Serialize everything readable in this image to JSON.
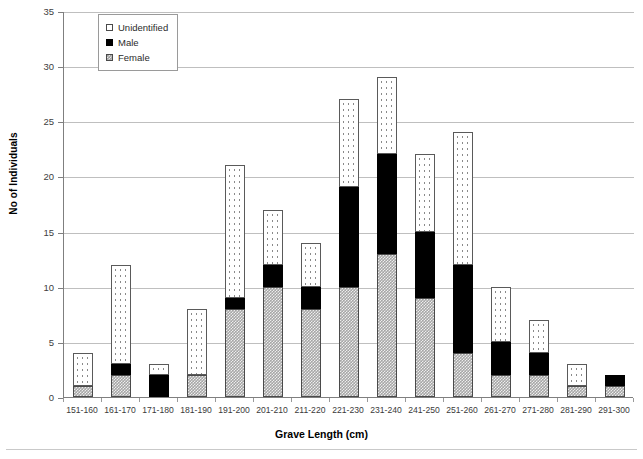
{
  "chart_data": {
    "type": "bar",
    "subtype": "stacked-vertical",
    "title": "",
    "xlabel": "Grave Length (cm)",
    "ylabel": "No of Individuals",
    "ylim": [
      0,
      35
    ],
    "ytick_step": 5,
    "yticks": [
      "0",
      "5",
      "10",
      "15",
      "20",
      "25",
      "30",
      "35"
    ],
    "grid": "horizontal",
    "legend_position": "top-left-inside",
    "categories": [
      "151-160",
      "161-170",
      "171-180",
      "181-190",
      "191-200",
      "201-210",
      "211-220",
      "221-230",
      "231-240",
      "241-250",
      "251-260",
      "261-270",
      "271-280",
      "281-290",
      "291-300"
    ],
    "series": [
      {
        "name": "Female",
        "fill": "checkered-gray",
        "color": "#a6a6a6",
        "values": [
          1,
          2,
          0,
          2,
          8,
          10,
          8,
          10,
          13,
          9,
          4,
          2,
          2,
          1,
          1
        ]
      },
      {
        "name": "Male",
        "fill": "solid-black",
        "color": "#000000",
        "values": [
          0,
          1,
          2,
          0,
          1,
          2,
          2,
          9,
          9,
          6,
          8,
          3,
          2,
          0,
          1
        ]
      },
      {
        "name": "Unidentified",
        "fill": "white-dotted",
        "color": "#ffffff",
        "values": [
          3,
          9,
          1,
          6,
          12,
          5,
          4,
          8,
          7,
          7,
          12,
          5,
          3,
          2,
          0
        ]
      }
    ],
    "totals": [
      4,
      12,
      3,
      8,
      21,
      17,
      14,
      27,
      29,
      22,
      24,
      10,
      7,
      3,
      2
    ]
  },
  "legend": {
    "items": [
      {
        "label": "Unidentified",
        "swatch": "unidentified"
      },
      {
        "label": "Male",
        "swatch": "male"
      },
      {
        "label": "Female",
        "swatch": "female"
      }
    ]
  },
  "axes": {
    "y_title": "No of Individuals",
    "x_title": "Grave Length (cm)"
  },
  "caption": {
    "text": ""
  }
}
